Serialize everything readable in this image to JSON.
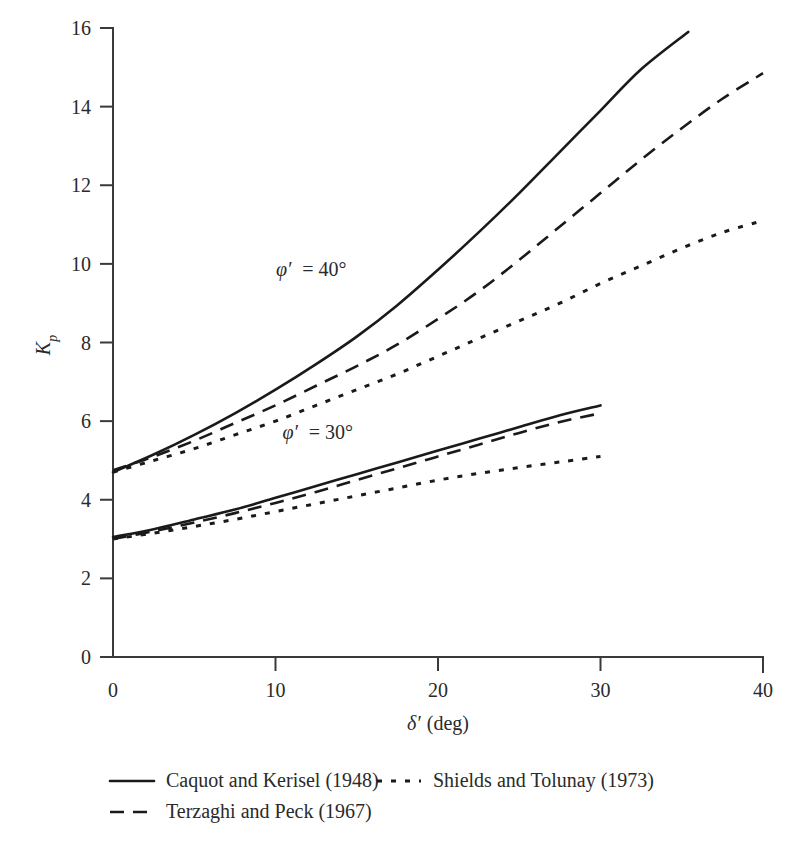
{
  "chart_data": {
    "type": "line",
    "title": "",
    "xlabel": "δ′ (deg)",
    "ylabel": "Kₚ",
    "xlabel_symbol": "δ′",
    "xlabel_unit": "(deg)",
    "ylabel_symbol": "K",
    "ylabel_sub": "p",
    "xlim": [
      0,
      40
    ],
    "ylim": [
      0,
      16
    ],
    "xticks": [
      "0",
      "10",
      "20",
      "30",
      "40"
    ],
    "xtick_values": [
      0,
      10,
      20,
      30,
      40
    ],
    "yticks": [
      "0",
      "2",
      "4",
      "6",
      "8",
      "10",
      "12",
      "14",
      "16"
    ],
    "ytick_values": [
      0,
      2,
      4,
      6,
      8,
      10,
      12,
      14,
      16
    ],
    "grid": false,
    "legend_position": "below-axes",
    "annotations": [
      {
        "text": "φ′ = 40°",
        "x": 12.2,
        "y": 9.7,
        "group": "phi40"
      },
      {
        "text": "φ′ = 30°",
        "x": 12.6,
        "y": 5.55,
        "group": "phi30"
      }
    ],
    "series": [
      {
        "name": "Caquot and Kerisel (1948)",
        "style": "solid",
        "group": "phi40",
        "x": [
          0,
          2.5,
          5,
          7.5,
          10,
          12.5,
          15,
          17.5,
          20,
          22.5,
          25,
          27.5,
          30,
          32.5,
          35.4
        ],
        "y": [
          4.7,
          5.15,
          5.65,
          6.2,
          6.8,
          7.45,
          8.15,
          8.95,
          9.85,
          10.8,
          11.8,
          12.85,
          13.9,
          14.95,
          15.9
        ]
      },
      {
        "name": "Terzaghi and Peck (1967)",
        "style": "dashed",
        "group": "phi40",
        "x": [
          0,
          2.5,
          5,
          7.5,
          10,
          12.5,
          15,
          17.5,
          20,
          22.5,
          25,
          27.5,
          30,
          32.5,
          35,
          37.5,
          40
        ],
        "y": [
          4.75,
          5.1,
          5.5,
          5.95,
          6.4,
          6.9,
          7.4,
          7.95,
          8.6,
          9.3,
          10.1,
          10.95,
          11.8,
          12.65,
          13.45,
          14.2,
          14.85
        ]
      },
      {
        "name": "Shields and Tolunay (1973)",
        "style": "dotted",
        "group": "phi40",
        "x": [
          0,
          2.5,
          5,
          7.5,
          10,
          12.5,
          15,
          17.5,
          20,
          22.5,
          25,
          27.5,
          30,
          32.5,
          35,
          37.5,
          40
        ],
        "y": [
          4.7,
          5.0,
          5.3,
          5.65,
          6.0,
          6.4,
          6.8,
          7.2,
          7.65,
          8.1,
          8.55,
          9.0,
          9.5,
          9.95,
          10.4,
          10.8,
          11.1
        ]
      },
      {
        "name": "Caquot and Kerisel (1948)",
        "style": "solid",
        "group": "phi30",
        "x": [
          0,
          2.5,
          5,
          7.5,
          10,
          12.5,
          15,
          17.5,
          20,
          22.5,
          25,
          27.5,
          30
        ],
        "y": [
          3.05,
          3.25,
          3.5,
          3.75,
          4.05,
          4.35,
          4.65,
          4.95,
          5.25,
          5.55,
          5.85,
          6.15,
          6.4
        ]
      },
      {
        "name": "Terzaghi and Peck (1967)",
        "style": "dashed",
        "group": "phi30",
        "x": [
          0,
          2.5,
          5,
          7.5,
          10,
          12.5,
          15,
          17.5,
          20,
          22.5,
          25,
          27.5,
          30
        ],
        "y": [
          3.0,
          3.2,
          3.42,
          3.66,
          3.92,
          4.2,
          4.5,
          4.8,
          5.1,
          5.4,
          5.7,
          5.98,
          6.2
        ]
      },
      {
        "name": "Shields and Tolunay (1973)",
        "style": "dotted",
        "group": "phi30",
        "x": [
          0,
          2.5,
          5,
          7.5,
          10,
          12.5,
          15,
          17.5,
          20,
          22.5,
          25,
          27.5,
          30
        ],
        "y": [
          3.0,
          3.15,
          3.32,
          3.5,
          3.7,
          3.9,
          4.1,
          4.3,
          4.5,
          4.67,
          4.82,
          4.96,
          5.1
        ]
      }
    ],
    "legend": [
      {
        "label": "Caquot and Kerisel (1948)",
        "style": "solid"
      },
      {
        "label": "Shields and Tolunay (1973)",
        "style": "dotted"
      },
      {
        "label": "Terzaghi and Peck (1967)",
        "style": "dashed"
      }
    ]
  }
}
